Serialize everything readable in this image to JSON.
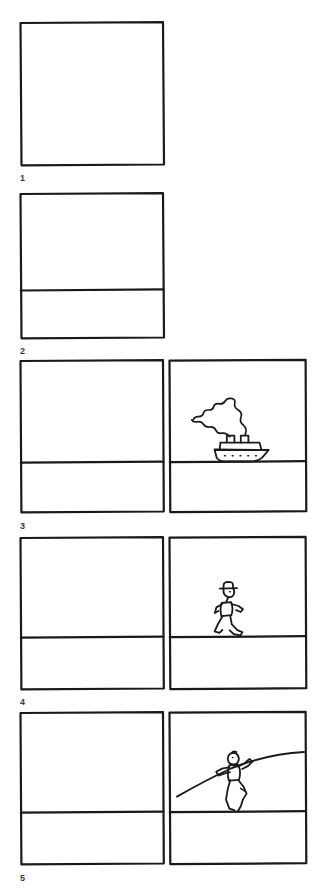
{
  "document": {
    "kind": "storyboard",
    "title_strip": "",
    "background_color": "#ffffff",
    "ink_color": "#1a1a1a",
    "caption_color": "#3a3a3a",
    "page_width": 330,
    "page_height": 895
  },
  "panels": [
    {
      "id": "panel-1",
      "caption": "1",
      "layout": "single-square",
      "boxes": 1,
      "has_horizon": false,
      "subject": "empty",
      "subject_label": "",
      "x": 20,
      "y": 22,
      "width": 144,
      "height": 143
    },
    {
      "id": "panel-2",
      "caption": "2",
      "layout": "single-square",
      "boxes": 1,
      "has_horizon": true,
      "subject": "empty",
      "subject_label": "",
      "x": 20,
      "y": 193,
      "width": 144,
      "height": 145,
      "horizon_y": 290
    },
    {
      "id": "panel-3",
      "caption": "3",
      "layout": "double-wide",
      "boxes": 2,
      "has_horizon": true,
      "subject": "steamship",
      "subject_label": "ocean liner with smoke",
      "x": 20,
      "y": 360,
      "width": 286,
      "height": 152,
      "horizon_y": 462
    },
    {
      "id": "panel-4",
      "caption": "4",
      "layout": "double-wide",
      "boxes": 2,
      "has_horizon": true,
      "subject": "running-figure",
      "subject_label": "man in hat running",
      "x": 20,
      "y": 537,
      "width": 286,
      "height": 152,
      "horizon_y": 637
    },
    {
      "id": "panel-5",
      "caption": "5",
      "layout": "double-wide",
      "boxes": 2,
      "has_horizon": true,
      "subject": "pole-figure",
      "subject_label": "man holding long pole",
      "x": 20,
      "y": 712,
      "width": 286,
      "height": 152,
      "horizon_y": 812
    }
  ],
  "captions": {
    "c1": "1",
    "c2": "2",
    "c3": "3",
    "c4": "4",
    "c5": "5"
  },
  "drawings": {
    "ship": {
      "name": "steamship",
      "elements": [
        "hull",
        "deck-house",
        "funnel-left",
        "funnel-right",
        "smoke-plume",
        "portholes"
      ],
      "porthole_count": 5,
      "funnel_count": 2
    },
    "runner": {
      "name": "running-figure",
      "elements": [
        "hat",
        "head",
        "torso",
        "left-arm",
        "right-arm",
        "front-leg",
        "back-leg"
      ]
    },
    "poleman": {
      "name": "pole-figure",
      "elements": [
        "head",
        "torso",
        "arms",
        "legs",
        "long-pole"
      ]
    }
  }
}
